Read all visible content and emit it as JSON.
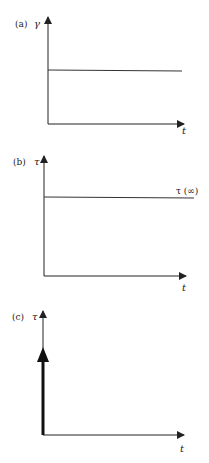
{
  "panels": [
    {
      "label": "(a)",
      "y_axis_symbol": "γ",
      "x_axis_symbol": "t",
      "description": "constant strain step applied"
    },
    {
      "label": "(b)",
      "y_axis_symbol": "τ",
      "x_axis_symbol": "t",
      "curve_label": "τ (∞)",
      "description": "constant stress response"
    },
    {
      "label": "(c)",
      "y_axis_symbol": "τ",
      "x_axis_symbol": "t",
      "description": "impulse (delta) stress at t = 0"
    }
  ],
  "colors": {
    "ink": "#222222",
    "background": "#ffffff"
  }
}
